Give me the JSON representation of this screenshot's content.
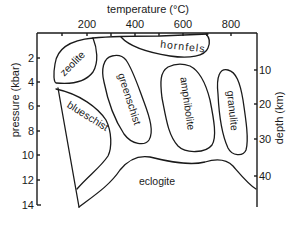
{
  "diagram": {
    "top_axis": {
      "label": "temperature (°C)",
      "ticks": [
        "200",
        "400",
        "600",
        "800"
      ]
    },
    "left_axis": {
      "label": "pressure (kbar)",
      "ticks": [
        "2",
        "4",
        "6",
        "8",
        "10",
        "12",
        "14"
      ]
    },
    "right_axis": {
      "label": "depth (km)",
      "ticks": [
        "10",
        "20",
        "30",
        "40"
      ]
    },
    "facies": {
      "zeolite": "zeolite",
      "hornfels": "hornfels",
      "greenschist": "greenschist",
      "amphibolite": "amphibolite",
      "granulite": "granulite",
      "blueschist": "blueschist",
      "eclogite": "eclogite"
    },
    "colors": {
      "line": "#1a1a1a",
      "background": "#ffffff"
    }
  }
}
